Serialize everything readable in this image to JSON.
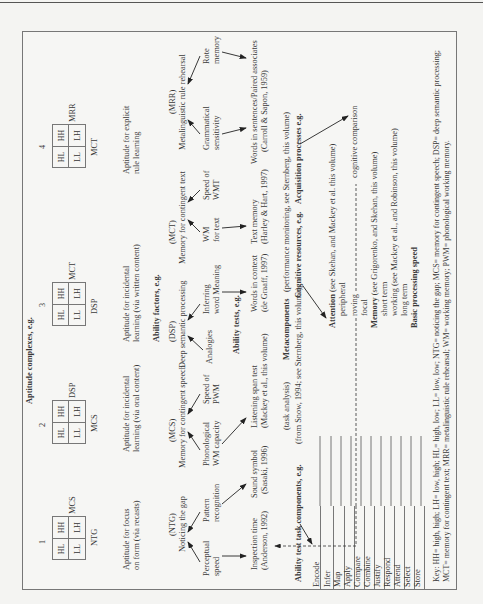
{
  "figure": {
    "heading": "Aptitude complexes, e.g.",
    "complexes": [
      {
        "number": "1",
        "cells": [
          "HL",
          "HH",
          "LL",
          "LH"
        ],
        "axis_right": "MCS",
        "axis_bottom": "NTG",
        "description": [
          "Aptitude for focus",
          "on form (via recasts)"
        ]
      },
      {
        "number": "2",
        "cells": [
          "HL",
          "HH",
          "LL",
          "LH"
        ],
        "axis_right": "DSP",
        "axis_bottom": "MCS",
        "description": [
          "Aptitude for incidental",
          "learning (via oral content)"
        ]
      },
      {
        "number": "3",
        "cells": [
          "HL",
          "HH",
          "LL",
          "LH"
        ],
        "axis_right": "MCT",
        "axis_bottom": "DSP",
        "description": [
          "Aptitude for incidental",
          "learning (via written content)"
        ]
      },
      {
        "number": "4",
        "cells": [
          "HL",
          "HH",
          "LL",
          "LH"
        ],
        "axis_right": "MRR",
        "axis_bottom": "MCT",
        "description": [
          "Aptitude for explicit",
          "rule learning"
        ]
      }
    ],
    "ability_factors_heading": "Ability factors, e.g.",
    "ability_factors": [
      {
        "abbr": "(NTG)",
        "name": "Noticing the gap",
        "inputs": [
          [
            "Perceptual",
            "speed"
          ],
          [
            "Pattern",
            "recognition"
          ]
        ]
      },
      {
        "abbr": "(MCS)",
        "name": "Memory for contingent speech",
        "inputs": [
          [
            "Phonological",
            "WM capacity"
          ],
          [
            "Speed of",
            "PWM"
          ]
        ]
      },
      {
        "abbr": "(DSP)",
        "name": "Deep semantic processing",
        "inputs": [
          [
            "Analogies"
          ],
          [
            "Inferring",
            "word Meaning"
          ]
        ]
      },
      {
        "abbr": "(MCT)",
        "name": "Memory for contingent text",
        "inputs": [
          [
            "WM",
            "for text"
          ],
          [
            "Speed of",
            "WMT"
          ]
        ]
      },
      {
        "abbr": "(MRR)",
        "name": "Metalinguistic rule rehearsal",
        "inputs": [
          [
            "Grammatical",
            "sensitivity"
          ],
          [
            "Rote",
            "memory"
          ]
        ]
      }
    ],
    "ability_tests_heading": "Ability tests, e.g.",
    "ability_tests": [
      [
        "Inspection time",
        "(Anderson, 1992)"
      ],
      [
        "Sound symbol",
        "(Sasaki, 1996)"
      ],
      [
        "Listening span test",
        "(Mackey et al., this volume)"
      ],
      [
        "Words in context",
        "(de Graaff, 1997)"
      ],
      [
        "Text memory",
        "(Harley & Hart, 1997)"
      ],
      [
        "Words in sentences/Paired associates",
        "(Carroll & Sapon, 1959)"
      ]
    ],
    "task_analysis": "(task analysis)",
    "metacomponents": "Metacomponents",
    "performance_monitoring": "(performance monitoring, see Sternberg, this volume)",
    "components_heading": "Ability test task components, e.g.",
    "from_snow": "(from Snow, 1994; see Sternberg, this volume)",
    "cognitive_resources": "Cognitive resources, e.g.",
    "acquisition_processes": "Acquisition processes e.g.",
    "components": [
      "Encode",
      "Infer",
      "Map",
      "Apply",
      "Compare",
      "Combine",
      "Justify",
      "Respond",
      "Attend",
      "Select",
      "Store"
    ],
    "resources": {
      "attention_label": "Attention",
      "attention_ref": " (see Skehan, and Mackey et al. this volume)",
      "attention_items": [
        "peripheral",
        "roving",
        "focal"
      ],
      "memory_label": "Memory",
      "memory_ref": " (see Grigorenko, and Skehan, this volume)",
      "memory_items": [
        "short term",
        "working (see Mackey et al., and Robinson, this volume)",
        "long term"
      ],
      "speed_label": "Basic processing speed"
    },
    "cognitive_comparison": "cognitive comparison",
    "key_line1": "Key: HH= high, high; LH= low, high; HL= high, low; LL= low, low; NTG= noticing the gap; MCS= memory for contingent speech; DSP= deep semantic processing;",
    "key_line2": "MCT= memory for contingent text; MRR= metalinguistic rule rehearsal; WM= working memory; PWM= phonological working memory."
  }
}
